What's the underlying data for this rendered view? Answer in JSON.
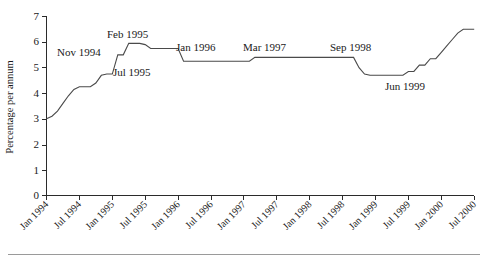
{
  "chart_data": {
    "type": "line",
    "title": "",
    "xlabel": "",
    "ylabel": "Percentage per annum",
    "ylim": [
      0,
      7
    ],
    "yticks": [
      0,
      1,
      2,
      3,
      4,
      5,
      6,
      7
    ],
    "ytick_labels": [
      "0",
      "1",
      "2",
      "3",
      "4",
      "5",
      "6",
      "7"
    ],
    "grid": false,
    "legend": "none",
    "xlim": [
      "Jan 1994",
      "Jul 2000"
    ],
    "xtick_labels": [
      "Jan 1994",
      "Jul 1994",
      "Jan 1995",
      "Jul 1995",
      "Jan 1996",
      "Jul 1996",
      "Jan 1997",
      "Jul 1997",
      "Jan 1998",
      "Jul 1998",
      "Jan 1999",
      "Jul 1999",
      "Jan 2000",
      "Jul 2000"
    ],
    "series": [
      {
        "name": "Interest rate",
        "x": [
          "Jan 1994",
          "Feb 1994",
          "Mar 1994",
          "Apr 1994",
          "May 1994",
          "Jun 1994",
          "Jul 1994",
          "Aug 1994",
          "Sep 1994",
          "Oct 1994",
          "Nov 1994",
          "Dec 1994",
          "Jan 1995",
          "Feb 1995",
          "Mar 1995",
          "Apr 1995",
          "May 1995",
          "Jun 1995",
          "Jul 1995",
          "Aug 1995",
          "Sep 1995",
          "Oct 1995",
          "Nov 1995",
          "Dec 1995",
          "Jan 1996",
          "Feb 1996",
          "Jul 1996",
          "Jan 1997",
          "Feb 1997",
          "Mar 1997",
          "Sep 1997",
          "Mar 1998",
          "Jul 1998",
          "Aug 1998",
          "Sep 1998",
          "Oct 1998",
          "Nov 1998",
          "Dec 1998",
          "Jan 1999",
          "Mar 1999",
          "Apr 1999",
          "May 1999",
          "Jun 1999",
          "Jul 1999",
          "Aug 1999",
          "Sep 1999",
          "Oct 1999",
          "Nov 1999",
          "Dec 1999",
          "Jan 2000",
          "Feb 2000",
          "Mar 2000",
          "Apr 2000",
          "May 2000",
          "Jun 2000",
          "Jul 2000"
        ],
        "values": [
          3.0,
          3.1,
          3.3,
          3.6,
          3.9,
          4.15,
          4.25,
          4.25,
          4.25,
          4.4,
          4.7,
          4.75,
          4.75,
          5.5,
          5.5,
          5.95,
          5.95,
          5.95,
          5.9,
          5.75,
          5.75,
          5.75,
          5.75,
          5.75,
          5.75,
          5.25,
          5.25,
          5.25,
          5.25,
          5.4,
          5.4,
          5.4,
          5.4,
          5.4,
          5.4,
          5.0,
          4.75,
          4.7,
          4.7,
          4.7,
          4.7,
          4.7,
          4.7,
          4.85,
          4.85,
          5.1,
          5.1,
          5.35,
          5.35,
          5.6,
          5.85,
          6.1,
          6.35,
          6.5,
          6.5,
          6.5
        ]
      }
    ],
    "annotations": [
      {
        "text": "Nov 1994",
        "x": "Nov 1994",
        "y": 5.95
      },
      {
        "text": "Feb 1995",
        "x": "Feb 1995",
        "y": 6.55
      },
      {
        "text": "Jul 1995",
        "x": "Jul 1995",
        "y": 5.25
      },
      {
        "text": "Jan 1996",
        "x": "Jan 1996",
        "y": 5.75
      },
      {
        "text": "Mar 1997",
        "x": "Mar 1997",
        "y": 5.9
      },
      {
        "text": "Sep 1998",
        "x": "Sep 1998",
        "y": 5.85
      },
      {
        "text": "Jun 1999",
        "x": "Jun 1999",
        "y": 4.2
      }
    ]
  },
  "axis": {
    "y_title": "Percentage per annum",
    "y_labels": [
      "7",
      "6",
      "5",
      "4",
      "3",
      "2",
      "1",
      "0"
    ],
    "x_labels": [
      "Jan 1994",
      "Jul 1994",
      "Jan 1995",
      "Jul 1995",
      "Jan 1996",
      "Jul 1996",
      "Jan 1997",
      "Jul 1997",
      "Jan 1998",
      "Jul 1998",
      "Jan 1999",
      "Jul 1999",
      "Jan 2000",
      "Jul 2000"
    ]
  },
  "annotations": {
    "a0": "Nov 1994",
    "a1": "Feb 1995",
    "a2": "Jul 1995",
    "a3": "Jan 1996",
    "a4": "Mar 1997",
    "a5": "Sep 1998",
    "a6": "Jun 1999"
  },
  "colors": {
    "axis": "#2b2b2b",
    "line": "#4a4a4a",
    "text": "#1a1a1a",
    "rule": "#9a9a9a",
    "background": "#ffffff"
  }
}
